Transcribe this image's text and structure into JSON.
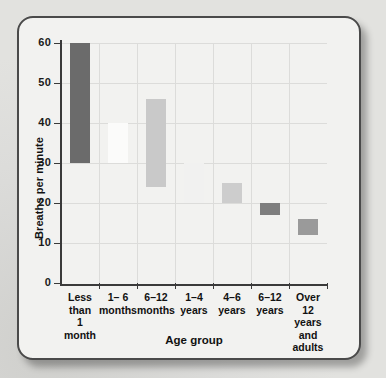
{
  "chart_data": {
    "type": "bar",
    "bar_style": "floating-range",
    "title": "",
    "xlabel": "Age group",
    "ylabel": "Breaths per minute",
    "ylim": [
      0,
      60
    ],
    "yticks": [
      0,
      10,
      20,
      30,
      40,
      50,
      60
    ],
    "grid": true,
    "legend": "none",
    "categories": [
      "Less than\n1 month",
      "1– 6\nmonths",
      "6–12\nmonths",
      "1–4\nyears",
      "4–6\nyears",
      "6–12\nyears",
      "Over 12\nyears\nand adults"
    ],
    "series": [
      {
        "name": "Normal breathing rate range",
        "low": [
          30,
          30,
          24,
          20,
          20,
          17,
          12
        ],
        "high": [
          60,
          40,
          46,
          30,
          25,
          20,
          16
        ],
        "colors": [
          "#6b6b6b",
          "#fbfbfa",
          "#c9c9c9",
          "#f1f1f0",
          "#cdcdcd",
          "#7e7e7e",
          "#9a9a9a"
        ]
      }
    ]
  },
  "axis": {
    "y_tick_labels": [
      "60",
      "50",
      "40",
      "30",
      "20",
      "10",
      "0"
    ],
    "y_title": "Breaths per minute",
    "x_title": "Age group"
  },
  "colors": {
    "card_background": "#f2f2f0",
    "card_border": "#4a4a4a",
    "grid": "#dcdcda",
    "axis": "#3a3a3a",
    "text": "#111111",
    "page_background": "#d8d8d6"
  }
}
